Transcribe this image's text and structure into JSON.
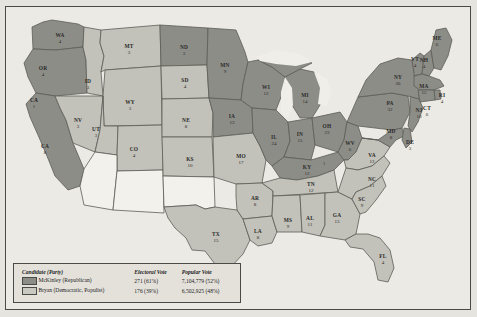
{
  "map": {
    "title": "Presidential Election of 1896",
    "colors": {
      "mckinley": "#8d8d88",
      "bryan": "#c2c1ba",
      "territory": "#f2f1ec",
      "water": "#efeee9",
      "border": "#4a4a46",
      "background": "#eceae4"
    }
  },
  "legend": {
    "headers": {
      "candidate": "Candidate (Party)",
      "electoral": "Electoral Vote",
      "popular": "Popular Vote"
    },
    "rows": [
      {
        "swatch": "mckinley-swatch",
        "candidate": "McKinley (Republican)",
        "electoral": "271 (61%)",
        "popular": "7,104,779 (52%)"
      },
      {
        "swatch": "bryan-swatch",
        "candidate": "Bryan (Democratic, Populist)",
        "electoral": "176 (39%)",
        "popular": "6,502,925 (48%)"
      }
    ]
  },
  "states": [
    {
      "code": "WA",
      "votes": "4",
      "winner": "mckinley",
      "x": 60,
      "y": 37
    },
    {
      "code": "OR",
      "votes": "4",
      "winner": "mckinley",
      "x": 43,
      "y": 70
    },
    {
      "code": "CA",
      "votes": "8",
      "winner": "mckinley",
      "x": 45,
      "y": 148
    },
    {
      "code": "CA1",
      "votes": "1",
      "winner": "bryan",
      "x": 34,
      "y": 102,
      "label": ""
    },
    {
      "code": "NV",
      "votes": "3",
      "winner": "bryan",
      "x": 78,
      "y": 122
    },
    {
      "code": "ID",
      "votes": "3",
      "winner": "bryan",
      "x": 88,
      "y": 83
    },
    {
      "code": "MT",
      "votes": "3",
      "winner": "bryan",
      "x": 129,
      "y": 48
    },
    {
      "code": "WY",
      "votes": "3",
      "winner": "bryan",
      "x": 130,
      "y": 104
    },
    {
      "code": "UT",
      "votes": "3",
      "winner": "bryan",
      "x": 96,
      "y": 131
    },
    {
      "code": "CO",
      "votes": "4",
      "winner": "bryan",
      "x": 134,
      "y": 151
    },
    {
      "code": "AZ",
      "votes": "",
      "winner": "territory",
      "x": 92,
      "y": 190
    },
    {
      "code": "NM",
      "votes": "",
      "winner": "territory",
      "x": 140,
      "y": 196
    },
    {
      "code": "ND",
      "votes": "3",
      "winner": "mckinley",
      "x": 184,
      "y": 49
    },
    {
      "code": "SD",
      "votes": "4",
      "winner": "bryan",
      "x": 185,
      "y": 82
    },
    {
      "code": "NE",
      "votes": "8",
      "winner": "bryan",
      "x": 186,
      "y": 122
    },
    {
      "code": "KS",
      "votes": "10",
      "winner": "bryan",
      "x": 190,
      "y": 161
    },
    {
      "code": "OK",
      "votes": "",
      "winner": "territory",
      "x": 186,
      "y": 196
    },
    {
      "code": "TX",
      "votes": "15",
      "winner": "bryan",
      "x": 216,
      "y": 236
    },
    {
      "code": "MN",
      "votes": "9",
      "winner": "mckinley",
      "x": 225,
      "y": 67
    },
    {
      "code": "IA",
      "votes": "13",
      "winner": "mckinley",
      "x": 232,
      "y": 118
    },
    {
      "code": "MO",
      "votes": "17",
      "winner": "bryan",
      "x": 241,
      "y": 158
    },
    {
      "code": "AR",
      "votes": "8",
      "winner": "bryan",
      "x": 255,
      "y": 200
    },
    {
      "code": "LA",
      "votes": "8",
      "winner": "bryan",
      "x": 258,
      "y": 233
    },
    {
      "code": "WI",
      "votes": "12",
      "winner": "mckinley",
      "x": 266,
      "y": 89
    },
    {
      "code": "IL",
      "votes": "24",
      "winner": "mckinley",
      "x": 274,
      "y": 139
    },
    {
      "code": "MS",
      "votes": "9",
      "winner": "bryan",
      "x": 288,
      "y": 222
    },
    {
      "code": "MI",
      "votes": "14",
      "winner": "mckinley",
      "x": 305,
      "y": 97
    },
    {
      "code": "IN",
      "votes": "15",
      "winner": "mckinley",
      "x": 300,
      "y": 136
    },
    {
      "code": "KY",
      "votes": "12",
      "winner": "mckinley",
      "x": 307,
      "y": 169
    },
    {
      "code": "TN",
      "votes": "12",
      "winner": "bryan",
      "x": 311,
      "y": 186
    },
    {
      "code": "AL",
      "votes": "11",
      "winner": "bryan",
      "x": 310,
      "y": 220
    },
    {
      "code": "OH",
      "votes": "23",
      "winner": "mckinley",
      "x": 327,
      "y": 128
    },
    {
      "code": "GA",
      "votes": "13",
      "winner": "bryan",
      "x": 337,
      "y": 217
    },
    {
      "code": "FL",
      "votes": "4",
      "winner": "bryan",
      "x": 383,
      "y": 258
    },
    {
      "code": "WV",
      "votes": "6",
      "winner": "mckinley",
      "x": 350,
      "y": 145
    },
    {
      "code": "SC",
      "votes": "9",
      "winner": "bryan",
      "x": 362,
      "y": 201
    },
    {
      "code": "NC",
      "votes": "11",
      "winner": "bryan",
      "x": 372,
      "y": 181
    },
    {
      "code": "VA",
      "votes": "12",
      "winner": "bryan",
      "x": 372,
      "y": 157
    },
    {
      "code": "MD",
      "votes": "8",
      "winner": "mckinley",
      "x": 391,
      "y": 133
    },
    {
      "code": "DE",
      "votes": "3",
      "winner": "mckinley",
      "x": 410,
      "y": 144
    },
    {
      "code": "PA",
      "votes": "32",
      "winner": "mckinley",
      "x": 390,
      "y": 105
    },
    {
      "code": "NJ",
      "votes": "10",
      "winner": "mckinley",
      "x": 419,
      "y": 112
    },
    {
      "code": "NY",
      "votes": "36",
      "winner": "mckinley",
      "x": 398,
      "y": 79
    },
    {
      "code": "CT",
      "votes": "6",
      "winner": "mckinley",
      "x": 427,
      "y": 110
    },
    {
      "code": "RI",
      "votes": "4",
      "winner": "mckinley",
      "x": 442,
      "y": 97
    },
    {
      "code": "MA",
      "votes": "15",
      "winner": "mckinley",
      "x": 424,
      "y": 88
    },
    {
      "code": "VT",
      "votes": "4",
      "winner": "mckinley",
      "x": 415,
      "y": 61
    },
    {
      "code": "NH",
      "votes": "4",
      "winner": "mckinley",
      "x": 424,
      "y": 62
    },
    {
      "code": "ME",
      "votes": "6",
      "winner": "mckinley",
      "x": 437,
      "y": 40
    }
  ],
  "split_markers": [
    {
      "value": "1",
      "x": 36,
      "y": 101
    },
    {
      "value": "1",
      "x": 324,
      "y": 165
    }
  ]
}
